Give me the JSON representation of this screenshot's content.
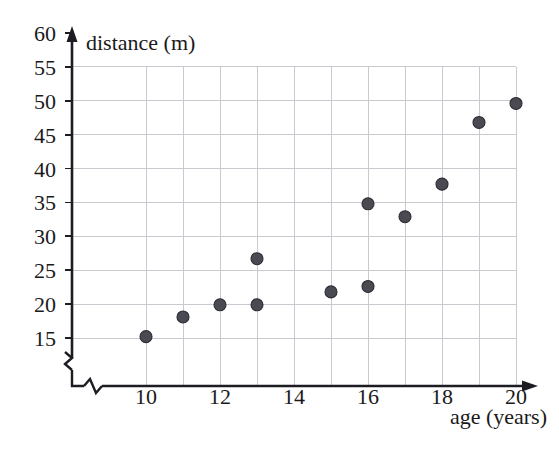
{
  "chart_data": {
    "type": "scatter",
    "title": "",
    "xlabel": "age (years)",
    "ylabel": "distance (m)",
    "xlim": [
      9,
      20.6
    ],
    "ylim": [
      13.5,
      60
    ],
    "grid": true,
    "legend": "none",
    "axis_break_x": true,
    "axis_break_y": true,
    "x_ticks": [
      10,
      12,
      14,
      16,
      18,
      20
    ],
    "x_tick_labels": [
      "10",
      "12",
      "14",
      "16",
      "18",
      "20"
    ],
    "x_gridlines": [
      10,
      11,
      12,
      13,
      14,
      15,
      16,
      17,
      18,
      19,
      20
    ],
    "y_ticks": [
      15,
      20,
      25,
      30,
      35,
      40,
      45,
      50,
      55,
      60
    ],
    "y_tick_labels": [
      "15",
      "20",
      "25",
      "30",
      "35",
      "40",
      "45",
      "50",
      "55",
      "60"
    ],
    "y_gridlines": [
      15,
      20,
      25,
      30,
      35,
      40,
      45,
      50,
      55
    ],
    "point_color": "#4a4a52",
    "grid_color": "#c9c9cf",
    "axis_color": "#1c1c22",
    "marker_radius": 6,
    "points": [
      {
        "x": 10,
        "y": 15.2
      },
      {
        "x": 11,
        "y": 18.1
      },
      {
        "x": 12,
        "y": 19.9
      },
      {
        "x": 13,
        "y": 26.7
      },
      {
        "x": 13,
        "y": 19.9
      },
      {
        "x": 15,
        "y": 21.8
      },
      {
        "x": 16,
        "y": 34.8
      },
      {
        "x": 16,
        "y": 22.6
      },
      {
        "x": 17,
        "y": 32.9
      },
      {
        "x": 18,
        "y": 37.7
      },
      {
        "x": 19,
        "y": 46.8
      },
      {
        "x": 20,
        "y": 49.6
      }
    ]
  }
}
